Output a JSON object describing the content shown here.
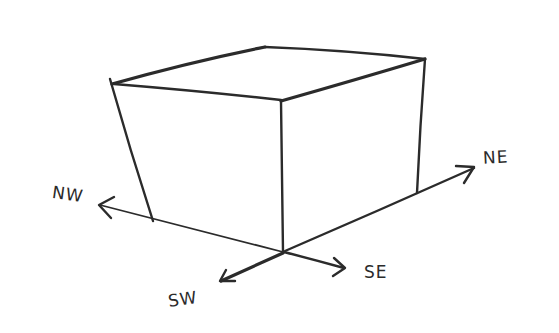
{
  "diagram": {
    "type": "hand-drawn sketch",
    "stroke_color": "#2b2b2b",
    "background_color": "#ffffff",
    "labels": {
      "nw": "NW",
      "ne": "NE",
      "sw": "SW",
      "se": "SE"
    },
    "cube": {
      "top_face": [
        "left-corner",
        "back-corner",
        "right-corner",
        "front-corner"
      ],
      "visible_vertical_edges": [
        "left-edge",
        "front-edge",
        "right-edge"
      ]
    },
    "axes": [
      {
        "direction": "NW",
        "arrow": true
      },
      {
        "direction": "NE",
        "arrow": true
      },
      {
        "direction": "SW",
        "arrow": true
      },
      {
        "direction": "SE",
        "arrow": true
      }
    ]
  }
}
